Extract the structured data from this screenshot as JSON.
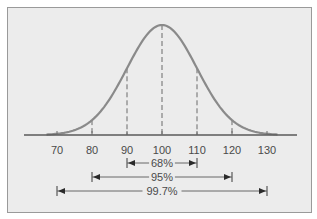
{
  "chart_data": {
    "type": "line",
    "title": "",
    "xlabel": "",
    "ylabel": "",
    "distribution": "normal",
    "mean": 100,
    "sd": 10,
    "x_ticks": [
      70,
      80,
      90,
      100,
      110,
      120,
      130
    ],
    "x_tick_labels": [
      "70",
      "80",
      "90",
      "100",
      "110",
      "120",
      "130"
    ],
    "dashed_lines_at": [
      80,
      90,
      100,
      110,
      120
    ],
    "intervals": [
      {
        "label": "68%",
        "from": 90,
        "to": 110
      },
      {
        "label": "95%",
        "from": 80,
        "to": 120
      },
      {
        "label": "99.7%",
        "from": 70,
        "to": 130
      }
    ],
    "grid": false,
    "colors": {
      "curve": "#8a8a8a",
      "background": "#ececec",
      "axis": "#5a5a5a",
      "text": "#4a4a4a"
    }
  }
}
